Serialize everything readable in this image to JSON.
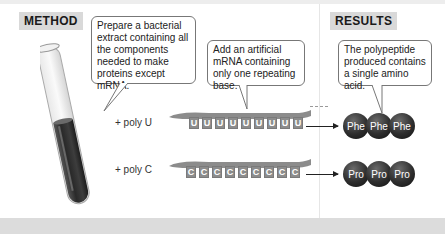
{
  "method": {
    "label": "METHOD",
    "bubble1": "Prepare a bacterial extract containing all the components needed to make proteins except mRNA.",
    "bubble2": "Add an artificial mRNA containing only one repeating base."
  },
  "results": {
    "label": "RESULTS",
    "bubble": "The polypeptide produced contains a single amino acid."
  },
  "rows": [
    {
      "poly_label": "+ poly U",
      "base": "U",
      "base_count": 9,
      "amino_acids": [
        "Phe",
        "Phe",
        "Phe"
      ]
    },
    {
      "poly_label": "+ poly C",
      "base": "C",
      "base_count": 9,
      "amino_acids": [
        "Pro",
        "Pro",
        "Pro"
      ]
    }
  ],
  "colors": {
    "label_bg": "#d9d9d9",
    "strand": "#8c8c8c",
    "amino_acid": "#2e2e2e",
    "tube_liquid": "#3a3a3a"
  }
}
